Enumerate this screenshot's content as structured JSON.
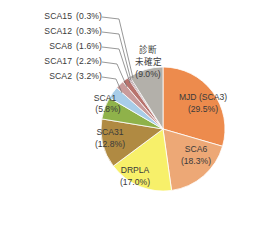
{
  "chart_data": {
    "type": "pie",
    "title": "",
    "subtitle": "",
    "xlabel": "",
    "ylabel": "",
    "legend_position": "none",
    "grid": false,
    "label_format": "{name} ({value}%)",
    "units": "percent",
    "start_angle_deg": 0,
    "direction": "clockwise",
    "categories": [
      "MJD (SCA3)",
      "SCA6",
      "DRPLA",
      "SCA31",
      "SCA1",
      "SCA2",
      "SCA17",
      "SCA8",
      "SCA12",
      "SCA15",
      "診断未確定"
    ],
    "values": [
      29.5,
      18.3,
      17.0,
      12.8,
      5.8,
      3.2,
      2.2,
      1.6,
      0.3,
      0.3,
      9.0
    ],
    "colors": [
      "#ED8B4D",
      "#EDA876",
      "#F7F06A",
      "#B08A42",
      "#8FB24A",
      "#A8CDE8",
      "#C99B9B",
      "#B8736E",
      "#8E5C66",
      "#6E4A57",
      "#B3B0AA"
    ],
    "slices": [
      {
        "name": "MJD (SCA3)",
        "value": 29.5,
        "label": "MJD  (SCA3)",
        "pct_label": "(29.5%)",
        "color": "#ED8B4D",
        "label_mode": "inside"
      },
      {
        "name": "SCA6",
        "value": 18.3,
        "label": "SCA6",
        "pct_label": "(18.3%)",
        "color": "#EDA876",
        "label_mode": "inside"
      },
      {
        "name": "DRPLA",
        "value": 17.0,
        "label": "DRPLA",
        "pct_label": "(17.0%)",
        "color": "#F7F06A",
        "label_mode": "inside"
      },
      {
        "name": "SCA31",
        "value": 12.8,
        "label": "SCA31",
        "pct_label": "(12.8%)",
        "color": "#B08A42",
        "label_mode": "inside"
      },
      {
        "name": "SCA1",
        "value": 5.8,
        "label": "SCA1",
        "pct_label": "(5.8%)",
        "color": "#8FB24A",
        "label_mode": "inside"
      },
      {
        "name": "SCA2",
        "value": 3.2,
        "label": "SCA2",
        "pct_label": "(3.2%)",
        "color": "#A8CDE8",
        "label_mode": "callout"
      },
      {
        "name": "SCA17",
        "value": 2.2,
        "label": "SCA17",
        "pct_label": "(2.2%)",
        "color": "#C99B9B",
        "label_mode": "callout"
      },
      {
        "name": "SCA8",
        "value": 1.6,
        "label": "SCA8",
        "pct_label": "(1.6%)",
        "color": "#B8736E",
        "label_mode": "callout"
      },
      {
        "name": "SCA12",
        "value": 0.3,
        "label": "SCA12",
        "pct_label": "(0.3%)",
        "color": "#8E5C66",
        "label_mode": "callout"
      },
      {
        "name": "SCA15",
        "value": 0.3,
        "label": "SCA15",
        "pct_label": "(0.3%)",
        "color": "#6E4A57",
        "label_mode": "callout"
      },
      {
        "name": "診断未確定",
        "value": 9.0,
        "label_lines": [
          "診断",
          "未確定"
        ],
        "pct_label": "(9.0%)",
        "color": "#B3B0AA",
        "label_mode": "inside"
      }
    ]
  },
  "callouts": [
    {
      "name": "SCA15",
      "pct": "(0.3%)"
    },
    {
      "name": "SCA12",
      "pct": "(0.3%)"
    },
    {
      "name": "SCA8",
      "pct": "(1.6%)"
    },
    {
      "name": "SCA17",
      "pct": "(2.2%)"
    },
    {
      "name": "SCA2",
      "pct": "(3.2%)"
    }
  ],
  "inside_labels": {
    "mjd": {
      "l1": "MJD  (SCA3)",
      "l2": "(29.5%)"
    },
    "sca6": {
      "l1": "SCA6",
      "l2": "(18.3%)"
    },
    "drpla": {
      "l1": "DRPLA",
      "l2": "(17.0%)"
    },
    "sca31": {
      "l1": "SCA31",
      "l2": "(12.8%)"
    },
    "sca1": {
      "l1": "SCA1",
      "l2": "(5.8%)"
    },
    "undiag": {
      "l1": "診断",
      "l2": "未確定",
      "l3": "(9.0%)"
    }
  }
}
